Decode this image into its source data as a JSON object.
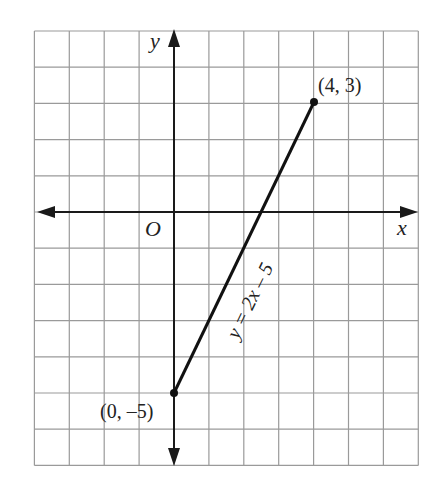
{
  "chart_data": {
    "type": "line",
    "title": "",
    "equation": "y = 2x – 5",
    "xlabel": "x",
    "ylabel": "y",
    "origin_label": "O",
    "xlim": [
      -4,
      7
    ],
    "ylim": [
      -7,
      5
    ],
    "grid": true,
    "series": [
      {
        "name": "y = 2x – 5",
        "x": [
          0,
          4
        ],
        "y": [
          -5,
          3
        ]
      }
    ],
    "points": [
      {
        "x": 0,
        "y": -5,
        "label": "(0, –5)"
      },
      {
        "x": 4,
        "y": 3,
        "label": "(4, 3)"
      }
    ]
  },
  "labels": {
    "x_axis": "x",
    "y_axis": "y",
    "origin": "O",
    "point_a": "(4, 3)",
    "point_b": "(0, –5)",
    "equation": "y = 2x – 5"
  },
  "colors": {
    "grid": "#9a9a9a",
    "axis": "#1a1a1a",
    "line": "#111111",
    "text": "#222222"
  }
}
